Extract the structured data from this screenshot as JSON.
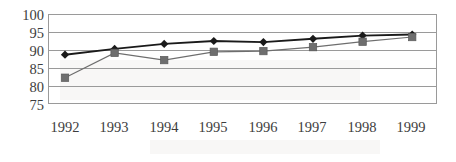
{
  "chart": {
    "title": "",
    "background_color": "#ffffff",
    "frame_color": "#9a9a9a"
  },
  "chart_data": {
    "type": "line",
    "title": "",
    "xlabel": "",
    "ylabel": "",
    "categories": [
      "1992",
      "1993",
      "1994",
      "1995",
      "1996",
      "1997",
      "1998",
      "1999"
    ],
    "ylim": [
      75,
      100
    ],
    "yticks": [
      75,
      80,
      85,
      90,
      95,
      100
    ],
    "grid": true,
    "legend": "none",
    "series": [
      {
        "name": "Series 1",
        "marker": "diamond",
        "color": "#1a1a1a",
        "values": [
          88.7,
          90.3,
          91.7,
          92.5,
          92.2,
          93.1,
          94.0,
          94.3
        ]
      },
      {
        "name": "Series 2",
        "marker": "square",
        "color": "#6e6e6e",
        "values": [
          82.3,
          89.2,
          87.2,
          89.5,
          89.7,
          90.8,
          92.3,
          93.6
        ]
      }
    ]
  }
}
